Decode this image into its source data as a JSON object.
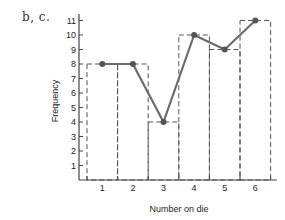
{
  "panel_label": "b, c.",
  "chart_data": {
    "type": "bar",
    "subtype": "histogram-with-frequency-polygon",
    "title": "",
    "xlabel": "Number on die",
    "ylabel": "Frequency",
    "categories": [
      "1",
      "2",
      "3",
      "4",
      "5",
      "6"
    ],
    "values": [
      8,
      8,
      4,
      10,
      9,
      11
    ],
    "series": [
      {
        "name": "Histogram (dashed bars)",
        "style": "dashed-outline",
        "values": [
          8,
          8,
          4,
          10,
          9,
          11
        ]
      },
      {
        "name": "Frequency polygon",
        "style": "line-with-markers",
        "values": [
          8,
          8,
          4,
          10,
          9,
          11
        ]
      }
    ],
    "yticks": [
      1,
      2,
      3,
      4,
      5,
      6,
      7,
      8,
      9,
      10,
      11
    ],
    "ylim": [
      0,
      11.5
    ],
    "grid": false,
    "legend": false
  },
  "colors": {
    "line": "#6b6b6b",
    "marker": "#555555",
    "bars": "#555555",
    "axis": "#444444"
  }
}
